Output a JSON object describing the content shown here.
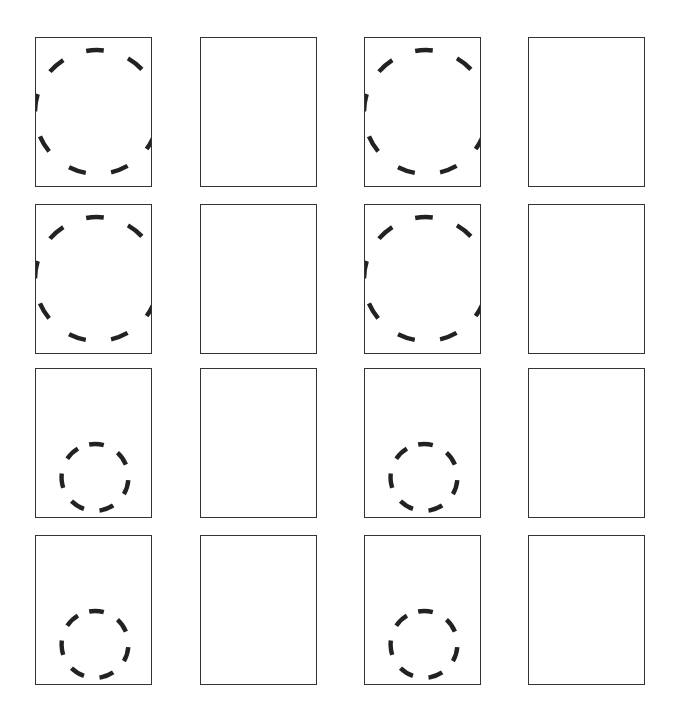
{
  "grid": {
    "rows": 4,
    "columns": 4,
    "panel_size": {
      "width": 117,
      "height": 150
    },
    "column_x": [
      35,
      200,
      364,
      528
    ],
    "row_y": [
      37,
      204,
      368,
      535
    ],
    "stroke_color": "#333333",
    "circle_color": "#222222"
  },
  "panels": [
    {
      "row": 0,
      "col": 0,
      "shape": "large-dashed-circle"
    },
    {
      "row": 0,
      "col": 1,
      "shape": "empty"
    },
    {
      "row": 0,
      "col": 2,
      "shape": "large-dashed-circle"
    },
    {
      "row": 0,
      "col": 3,
      "shape": "empty"
    },
    {
      "row": 1,
      "col": 0,
      "shape": "large-dashed-circle"
    },
    {
      "row": 1,
      "col": 1,
      "shape": "empty"
    },
    {
      "row": 1,
      "col": 2,
      "shape": "large-dashed-circle"
    },
    {
      "row": 1,
      "col": 3,
      "shape": "empty"
    },
    {
      "row": 2,
      "col": 0,
      "shape": "small-dashed-circle"
    },
    {
      "row": 2,
      "col": 1,
      "shape": "empty"
    },
    {
      "row": 2,
      "col": 2,
      "shape": "small-dashed-circle"
    },
    {
      "row": 2,
      "col": 3,
      "shape": "empty"
    },
    {
      "row": 3,
      "col": 0,
      "shape": "small-dashed-circle"
    },
    {
      "row": 3,
      "col": 1,
      "shape": "empty"
    },
    {
      "row": 3,
      "col": 2,
      "shape": "small-dashed-circle"
    },
    {
      "row": 3,
      "col": 3,
      "shape": "empty"
    }
  ],
  "shapes": {
    "large-dashed-circle": {
      "cx": 62,
      "cy": 75,
      "r": 63,
      "dash": "18 26",
      "stroke_width": 4.5
    },
    "small-dashed-circle": {
      "cx": 60,
      "cy": 110,
      "r": 34,
      "dash": "15 16",
      "stroke_width": 4.5
    }
  }
}
